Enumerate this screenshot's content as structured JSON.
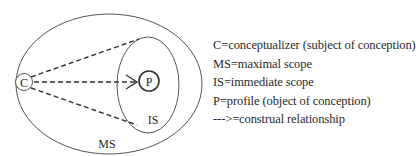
{
  "diagram": {
    "nodes": {
      "conceptualizer": {
        "label": "C"
      },
      "profile": {
        "label": "P"
      },
      "immediate_scope": {
        "label": "IS"
      },
      "maximal_scope": {
        "label": "MS"
      }
    },
    "stroke_color": "#333333"
  },
  "legend": {
    "items": [
      {
        "text": "C=conceptualizer (subject of conception)"
      },
      {
        "text": "MS=maximal scope"
      },
      {
        "text": "IS=immediate scope"
      },
      {
        "text": "P=profile (object of conception)"
      },
      {
        "text": "--->=construal relationship"
      }
    ]
  }
}
